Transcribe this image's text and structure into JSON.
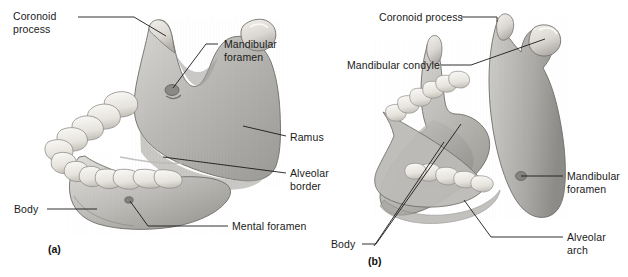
{
  "figure": {
    "title_alt": "Mandible — lateral and posterosuperior views",
    "background_color": "#ffffff",
    "bone_fill_light": "#e8e6e2",
    "bone_fill_mid": "#b9b7b3",
    "bone_fill_dark": "#8f8d8a",
    "tooth_fill": "#f4f2ee",
    "leader_color": "#1a1a1a",
    "text_color": "#1a1a1a"
  },
  "panels": [
    {
      "tag": "(a)",
      "tag_x": 48,
      "tag_y": 243,
      "view": "lateral"
    },
    {
      "tag": "(b)",
      "tag_x": 368,
      "tag_y": 255,
      "view": "posterosuperior"
    }
  ],
  "labels": [
    {
      "id": "coronoid-process-a",
      "panel": "(a)",
      "lines": [
        "Coronoid",
        "process"
      ],
      "x": 13,
      "y": 10,
      "align": "left",
      "leader": "M 78 17 L 134 17 L 166 36"
    },
    {
      "id": "mandibular-foramen-a",
      "panel": "(a)",
      "lines": [
        "Mandibular",
        "foramen"
      ],
      "x": 224,
      "y": 38,
      "align": "left",
      "leader": "M 218 44 L 206 44 L 173 88"
    },
    {
      "id": "ramus-a",
      "panel": "(a)",
      "lines": [
        "Ramus"
      ],
      "x": 290,
      "y": 131,
      "align": "left",
      "leader": "M 286 136 L 243 126"
    },
    {
      "id": "alveolar-border-a",
      "panel": "(a)",
      "lines": [
        "Alveolar",
        "border"
      ],
      "x": 290,
      "y": 167,
      "align": "left",
      "leader": "M 286 173 L 163 157"
    },
    {
      "id": "body-a",
      "panel": "(a)",
      "lines": [
        "Body"
      ],
      "x": 14,
      "y": 203,
      "align": "left",
      "leader": "M 47 209 L 97 209"
    },
    {
      "id": "mental-foramen-a",
      "panel": "(a)",
      "lines": [
        "Mental foramen"
      ],
      "x": 232,
      "y": 220,
      "align": "left",
      "leader": "M 228 226 L 148 226 L 130 201"
    },
    {
      "id": "coronoid-process-b",
      "panel": "(b)",
      "lines": [
        "Coronoid process"
      ],
      "x": 379,
      "y": 11,
      "align": "left",
      "leader": "M 461 17 L 497 17 L 497 22"
    },
    {
      "id": "mandibular-condyle-b",
      "panel": "(b)",
      "lines": [
        "Mandibular condyle"
      ],
      "x": 347,
      "y": 59,
      "align": "left",
      "leader": "M 441 65 L 471 65 L 545 39"
    },
    {
      "id": "mandibular-foramen-b",
      "panel": "(b)",
      "lines": [
        "Mandibular",
        "foramen"
      ],
      "x": 567,
      "y": 170,
      "align": "left",
      "leader": "M 563 176 L 521 176"
    },
    {
      "id": "alveolar-arch-b",
      "panel": "(b)",
      "lines": [
        "Alveolar",
        "arch"
      ],
      "x": 567,
      "y": 231,
      "align": "left",
      "leader": "M 563 237 L 491 237 L 464 200"
    },
    {
      "id": "body-b",
      "panel": "(b)",
      "lines": [
        "Body"
      ],
      "x": 331,
      "y": 238,
      "align": "left",
      "leader": "M 362 244 L 376 244 L 461 124"
    },
    {
      "id": "body-b-second",
      "panel": "(b)",
      "lines": [],
      "x": 0,
      "y": 0,
      "align": "left",
      "leader": "M 374 246 L 444 142"
    }
  ]
}
